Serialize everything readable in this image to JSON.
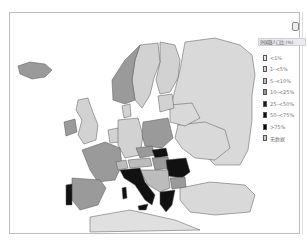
{
  "map": {
    "title": "",
    "region": "Europe",
    "background": "#ffffff",
    "border_color": "#555555"
  },
  "legend": {
    "title": "外国籍人口比 (%)",
    "items": [
      {
        "label": "<1%",
        "color": "#e6e6e6"
      },
      {
        "label": "1–<5%",
        "color": "#d2d2d2"
      },
      {
        "label": "5–<10%",
        "color": "#bcbcbc"
      },
      {
        "label": "10–<25%",
        "color": "#999999"
      },
      {
        "label": "25–<50%",
        "color": "#1a1a1a"
      },
      {
        "label": "50–<75%",
        "color": "#0d0d0d"
      },
      {
        "label": ">75%",
        "color": "#000000"
      },
      {
        "label": "无数据",
        "color": "#c8c8c8"
      }
    ]
  },
  "countries": {
    "Iceland": "#9a9a9a",
    "Norway": "#9a9a9a",
    "Sweden": "#d2d2d2",
    "Finland": "#d2d2d2",
    "Russia": "#d9d9d9",
    "UK": "#d2d2d2",
    "Ireland": "#9a9a9a",
    "France": "#9a9a9a",
    "Spain": "#9a9a9a",
    "Portugal": "#111111",
    "Germany": "#d2d2d2",
    "Poland": "#9a9a9a",
    "Italy": "#111111",
    "Romania": "#111111",
    "Bulgaria": "#9a9a9a",
    "Greece": "#111111",
    "Turkey": "#d9d9d9",
    "Ukraine": "#d9d9d9",
    "Belarus": "#d9d9d9",
    "Hungary": "#9a9a9a",
    "Slovakia": "#111111",
    "Austria": "#bcbcbc",
    "Balkans": "#bcbcbc",
    "Baltics": "#d2d2d2",
    "Denmark": "#d2d2d2",
    "Benelux": "#d2d2d2",
    "Czechia": "#9a9a9a",
    "Switzerland": "#bcbcbc",
    "North_Africa": "#e0e0e0"
  }
}
